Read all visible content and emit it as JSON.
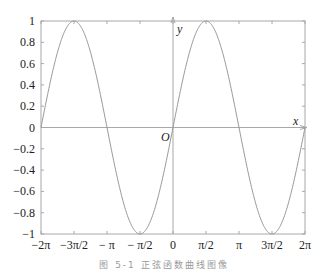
{
  "chart_data": {
    "type": "line",
    "title": "",
    "caption": "图 5-1   正弦函数曲线图像",
    "xlabel": "x",
    "ylabel": "y",
    "origin_label": "O",
    "function": "y = sin(x)",
    "xlim": [
      -6.2832,
      6.2832
    ],
    "ylim": [
      -1,
      1
    ],
    "grid": false,
    "legend": null,
    "x_ticks": [
      {
        "value": -6.2832,
        "label": "−2π"
      },
      {
        "value": -4.7124,
        "label": "−3π/2"
      },
      {
        "value": -3.1416,
        "label": "− π"
      },
      {
        "value": -1.5708,
        "label": "− π/2"
      },
      {
        "value": 0,
        "label": "0"
      },
      {
        "value": 1.5708,
        "label": "π/2"
      },
      {
        "value": 3.1416,
        "label": "π"
      },
      {
        "value": 4.7124,
        "label": "3π/2"
      },
      {
        "value": 6.2832,
        "label": "2π"
      }
    ],
    "y_ticks": [
      {
        "value": 1,
        "label": "1"
      },
      {
        "value": 0.8,
        "label": "0.8"
      },
      {
        "value": 0.6,
        "label": "0.6"
      },
      {
        "value": 0.4,
        "label": "0.4"
      },
      {
        "value": 0.2,
        "label": "0.2"
      },
      {
        "value": 0,
        "label": "0"
      },
      {
        "value": -0.2,
        "label": "−0.2"
      },
      {
        "value": -0.4,
        "label": "−0.4"
      },
      {
        "value": -0.6,
        "label": "−0.6"
      },
      {
        "value": -0.8,
        "label": "−0.8"
      },
      {
        "value": -1,
        "label": "−1"
      }
    ],
    "series": [
      {
        "name": "sin(x)",
        "color": "#999999",
        "x": [
          -6.2832,
          -4.7124,
          -3.1416,
          -1.5708,
          0,
          1.5708,
          3.1416,
          4.7124,
          6.2832
        ],
        "y": [
          0,
          1,
          0,
          -1,
          0,
          1,
          0,
          -1,
          0
        ]
      }
    ],
    "colors": {
      "frame": "#a8a8a8",
      "axes": "#a8a8a8",
      "curve": "#999999",
      "text": "#222222",
      "caption": "#9a9a9a"
    }
  }
}
